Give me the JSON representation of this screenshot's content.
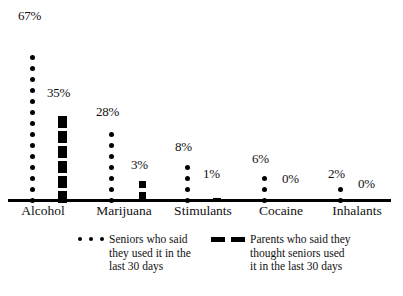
{
  "chart_data": {
    "type": "bar",
    "title": "",
    "subtitle": "",
    "xlabel": "",
    "ylabel": "",
    "ylim": [
      0,
      70
    ],
    "grid": false,
    "legend_position": "bottom",
    "units": "percent",
    "mark_style": "pictogram: each dot/dash ≈ 5 percentage points",
    "categories": [
      "Alcohol",
      "Marijuana",
      "Stimulants",
      "Cocaine",
      "Inhalants"
    ],
    "series": [
      {
        "name": "Seniors who said they used it in the last 30 days",
        "marker": "dot",
        "values": [
          67,
          28,
          8,
          6,
          2
        ],
        "value_labels": [
          "67%",
          "28%",
          "8%",
          "6%",
          "2%"
        ],
        "mark_counts": [
          14,
          7,
          4,
          3,
          2
        ]
      },
      {
        "name": "Parents who said they thought seniors used it in the last 30 days",
        "marker": "dash",
        "values": [
          35,
          3,
          1,
          0,
          0
        ],
        "value_labels": [
          "35%",
          "3%",
          "1%",
          "0%",
          "0%"
        ],
        "mark_counts": [
          6,
          2,
          1,
          0,
          0
        ]
      }
    ]
  },
  "axis": {
    "labels": [
      {
        "text": "Alcohol",
        "x": 43
      },
      {
        "text": "Marijuana",
        "x": 124
      },
      {
        "text": "Stimulants",
        "x": 203
      },
      {
        "text": "Cocaine",
        "x": 281
      },
      {
        "text": "Inhalants",
        "x": 357
      }
    ]
  },
  "plot": {
    "groups": [
      {
        "key": "alcohol",
        "left": 10,
        "width": 78,
        "series": [
          {
            "key": "seniors",
            "marker": "dot",
            "marks": 14,
            "offset_x": 20,
            "label": "67%",
            "label_x": 8,
            "label_y": 9
          },
          {
            "key": "parents",
            "marker": "dash",
            "marks": 6,
            "offset_x": 48,
            "label": "35%",
            "label_x": 37,
            "label_y": 86
          }
        ]
      },
      {
        "key": "marijuana",
        "left": 90,
        "width": 78,
        "series": [
          {
            "key": "seniors",
            "marker": "dot",
            "marks": 7,
            "offset_x": 19,
            "label": "28%",
            "label_x": 6,
            "label_y": 105
          },
          {
            "key": "parents",
            "marker": "dash",
            "marks": 2,
            "marker_size": "small",
            "offset_x": 49,
            "label": "3%",
            "label_x": 41,
            "label_y": 158
          }
        ]
      },
      {
        "key": "stimulants",
        "left": 170,
        "width": 78,
        "series": [
          {
            "key": "seniors",
            "marker": "dot",
            "marks": 4,
            "offset_x": 15,
            "label": "8%",
            "label_x": 5,
            "label_y": 140
          },
          {
            "key": "parents",
            "marker": "dash",
            "marks": 1,
            "marker_size": "tick",
            "offset_x": 43,
            "label": "1%",
            "label_x": 33,
            "label_y": 167
          }
        ]
      },
      {
        "key": "cocaine",
        "left": 248,
        "width": 78,
        "series": [
          {
            "key": "seniors",
            "marker": "dot",
            "marks": 3,
            "offset_x": 14,
            "label": "6%",
            "label_x": 4,
            "label_y": 152
          },
          {
            "key": "parents",
            "marker": "dash",
            "marks": 0,
            "offset_x": 44,
            "label": "0%",
            "label_x": 34,
            "label_y": 172
          }
        ]
      },
      {
        "key": "inhalants",
        "left": 322,
        "width": 78,
        "series": [
          {
            "key": "seniors",
            "marker": "dot",
            "marks": 2,
            "offset_x": 16,
            "label": "2%",
            "label_x": 6,
            "label_y": 167
          },
          {
            "key": "parents",
            "marker": "dash",
            "marks": 0,
            "offset_x": 46,
            "label": "0%",
            "label_x": 36,
            "label_y": 177
          }
        ]
      }
    ]
  },
  "legend": {
    "entries": [
      {
        "key": "seniors",
        "marker": "dot",
        "marker_count": 3,
        "left": 78,
        "top": 2,
        "text": "Seniors who said\nthey used it in the\nlast 30 days"
      },
      {
        "key": "parents",
        "marker": "dash",
        "marker_count": 2,
        "left": 211,
        "top": 2,
        "text": "Parents who said they\nthought seniors used\nit in the last 30 days"
      }
    ]
  },
  "colors": {
    "ink": "#000000",
    "background": "#ffffff"
  }
}
